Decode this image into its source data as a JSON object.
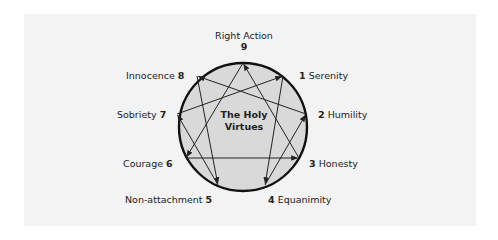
{
  "diagram": {
    "title_line1": "The Holy",
    "title_line2": "Virtues",
    "colors": {
      "panel_background": "#f3f3f3",
      "circle_fill": "#d9d9d9",
      "circle_stroke": "#111111",
      "line_color": "#222222"
    },
    "circle": {
      "cx": 243,
      "cy": 127,
      "r": 64
    },
    "points": [
      {
        "number": "9",
        "name": "Right Action",
        "x": 243,
        "y": 63
      },
      {
        "number": "1",
        "name": "Serenity",
        "x": 283,
        "y": 76
      },
      {
        "number": "2",
        "name": "Humility",
        "x": 306,
        "y": 114
      },
      {
        "number": "3",
        "name": "Honesty",
        "x": 299,
        "y": 158
      },
      {
        "number": "4",
        "name": "Equanimity",
        "x": 265,
        "y": 185
      },
      {
        "number": "5",
        "name": "Non-attachment",
        "x": 218,
        "y": 185
      },
      {
        "number": "6",
        "name": "Courage",
        "x": 186,
        "y": 158
      },
      {
        "number": "7",
        "name": "Sobriety",
        "x": 177,
        "y": 114
      },
      {
        "number": "8",
        "name": "Innocence",
        "x": 197,
        "y": 76
      }
    ],
    "arrows": [
      {
        "from": "3",
        "to": "9"
      },
      {
        "from": "9",
        "to": "6"
      },
      {
        "from": "6",
        "to": "3"
      },
      {
        "from": "1",
        "to": "4"
      },
      {
        "from": "4",
        "to": "2"
      },
      {
        "from": "2",
        "to": "8"
      },
      {
        "from": "8",
        "to": "5"
      },
      {
        "from": "5",
        "to": "7"
      },
      {
        "from": "7",
        "to": "1"
      }
    ]
  }
}
